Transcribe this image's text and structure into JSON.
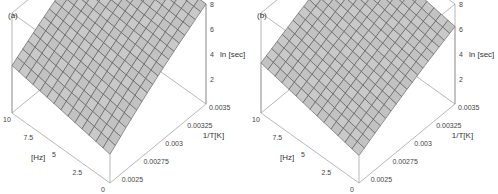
{
  "chart_data": [
    {
      "type": "surface3d",
      "panel_label": "(a)",
      "title": "",
      "x_axis": {
        "label": "1/T[K]",
        "ticks": [
          "0.0025",
          "0.00275",
          "0.003",
          "0.00325",
          "0.0035"
        ],
        "range": [
          0.0024,
          0.0035
        ]
      },
      "y_axis": {
        "label": "[Hz]",
        "ticks": [
          "0",
          "2.5",
          "5",
          "7.5",
          "10"
        ],
        "range": [
          0,
          10
        ]
      },
      "z_axis": {
        "label": "ln [sec]",
        "ticks": [
          "2",
          "4",
          "6",
          "8"
        ],
        "range": [
          0,
          8
        ]
      },
      "surface": {
        "description": "Planar-like surface rising steeply with 1/T and slightly with frequency",
        "corners": {
          "x_min_y_min": 2.3,
          "x_min_y_max": 3.8,
          "x_max_y_min": 8.0,
          "x_max_y_max": 8.5
        },
        "grid_x": 18,
        "grid_y": 14
      },
      "grid": false,
      "box": true
    },
    {
      "type": "surface3d",
      "panel_label": "(b)",
      "title": "",
      "x_axis": {
        "label": "1/T[K]",
        "ticks": [
          "0.0025",
          "0.00275",
          "0.003",
          "0.00325",
          "0.0035"
        ],
        "range": [
          0.0024,
          0.0035
        ]
      },
      "y_axis": {
        "label": "[Hz]",
        "ticks": [
          "0",
          "2.5",
          "5",
          "7.5",
          "10"
        ],
        "range": [
          0,
          10
        ]
      },
      "z_axis": {
        "label": "ln [sec]",
        "ticks": [
          "2",
          "4",
          "6",
          "8"
        ],
        "range": [
          0,
          8
        ]
      },
      "surface": {
        "description": "Flatter surface rising moderately with 1/T, nearly flat in frequency",
        "corners": {
          "x_min_y_min": 2.2,
          "x_min_y_max": 4.0,
          "x_max_y_min": 6.2,
          "x_max_y_max": 7.6
        },
        "grid_x": 18,
        "grid_y": 14
      },
      "grid": false,
      "box": true
    }
  ],
  "style": {
    "surface_fill": "#c9c9c9",
    "surface_fill_dark": "#a9a9a9",
    "mesh_color": "#4a4a4a",
    "box_color": "#9a9a9a"
  }
}
